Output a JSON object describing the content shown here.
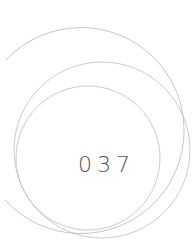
{
  "page_number": "037",
  "colors": {
    "ring": "#b8b8b8",
    "text": "#555555",
    "background": "#ffffff"
  }
}
